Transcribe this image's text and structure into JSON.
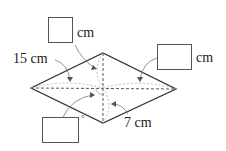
{
  "diagram": {
    "shape": "rhombus",
    "labels": {
      "top_unit": "cm",
      "right_unit": "cm",
      "left_length": "15 cm",
      "bottom_length": "7 cm",
      "degree_symbol": "°"
    },
    "answer_boxes": [
      {
        "id": "top",
        "value": "",
        "unit": "cm"
      },
      {
        "id": "right",
        "value": "",
        "unit": "cm"
      },
      {
        "id": "bottom-left",
        "value": "",
        "unit": "°"
      }
    ],
    "colors": {
      "stroke": "#333333",
      "dashed": "#555555",
      "arc": "#aaaaaa"
    }
  }
}
